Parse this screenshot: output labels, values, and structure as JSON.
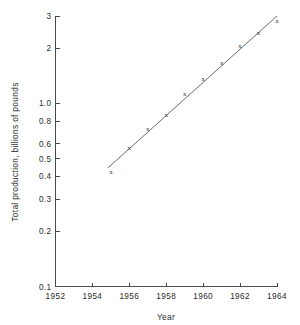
{
  "chart_data": {
    "type": "scatter",
    "title": "",
    "xlabel": "Year",
    "ylabel": "Total production, billions of pounds",
    "yscale": "log",
    "xscale": "linear",
    "grid": false,
    "legend": null,
    "xlim": [
      1952,
      1964
    ],
    "ylim": [
      0.1,
      3
    ],
    "xticks": [
      1952,
      1954,
      1956,
      1958,
      1960,
      1962,
      1964
    ],
    "xticklabels": [
      "1952",
      "1954",
      "1956",
      "1958",
      "1960",
      "1962",
      "1964"
    ],
    "yticks": [
      0.1,
      0.2,
      0.3,
      0.4,
      0.5,
      0.6,
      0.8,
      1.0,
      2,
      3
    ],
    "yticklabels": [
      "0.1",
      "0.2",
      "0.3",
      "0.4",
      "0.5",
      "0.6",
      "0.8",
      "1.0",
      "2",
      "3"
    ],
    "marker": "x",
    "x": [
      1955,
      1956,
      1957,
      1958,
      1959,
      1960,
      1961,
      1962,
      1963,
      1964
    ],
    "y": [
      0.42,
      0.57,
      0.72,
      0.86,
      1.12,
      1.35,
      1.65,
      2.05,
      2.4,
      2.8
    ],
    "series": [
      {
        "name": "Total production",
        "marker": "x",
        "points": [
          {
            "x": 1955,
            "y": 0.42
          },
          {
            "x": 1956,
            "y": 0.57
          },
          {
            "x": 1957,
            "y": 0.72
          },
          {
            "x": 1958,
            "y": 0.86
          },
          {
            "x": 1959,
            "y": 1.12
          },
          {
            "x": 1960,
            "y": 1.35
          },
          {
            "x": 1961,
            "y": 1.65
          },
          {
            "x": 1962,
            "y": 2.05
          },
          {
            "x": 1963,
            "y": 2.4
          },
          {
            "x": 1964,
            "y": 2.8
          }
        ]
      },
      {
        "name": "fitted trend line",
        "type": "line",
        "endpoints": [
          {
            "x": 1954.85,
            "y": 0.445
          },
          {
            "x": 1964.0,
            "y": 3.0
          }
        ]
      }
    ]
  },
  "axes": {
    "x_title": "Year",
    "y_title": "Total production, billions of pounds"
  },
  "colors": {
    "background": "#ffffff",
    "axis": "#4a4a4a",
    "line": "#5a5a5a",
    "marker": "#3a3a3a",
    "text": "#2b2b2b"
  }
}
